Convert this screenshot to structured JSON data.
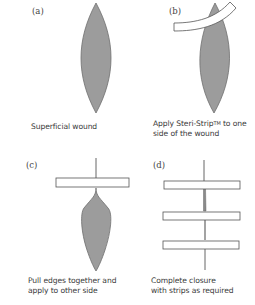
{
  "figure": {
    "colors": {
      "wound_fill": "#9c9c9c",
      "wound_stroke": "#6e6e6e",
      "strip_fill": "#ffffff",
      "strip_stroke": "#555555",
      "text": "#3a3a3a"
    },
    "panels": [
      {
        "label": "(a)",
        "caption_lines": [
          "Superficial wound"
        ]
      },
      {
        "label": "(b)",
        "caption_prefix": "Apply Steri-Strip",
        "caption_sup": "TM",
        "caption_suffix": " to one",
        "caption_line2": "side of the wound"
      },
      {
        "label": "(c)",
        "caption_lines": [
          "Pull edges together and",
          "apply to other side"
        ]
      },
      {
        "label": "(d)",
        "caption_lines": [
          "Complete closure",
          "with strips as required"
        ]
      }
    ]
  }
}
